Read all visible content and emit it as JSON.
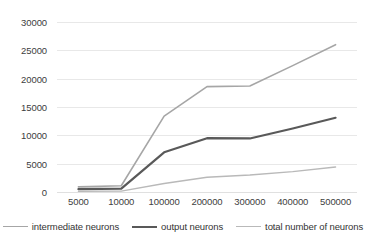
{
  "chart_data": {
    "type": "line",
    "title": "",
    "xlabel": "",
    "ylabel": "",
    "categories": [
      "5000",
      "10000",
      "100000",
      "200000",
      "300000",
      "400000",
      "500000"
    ],
    "ylim": [
      0,
      30000
    ],
    "yticks": [
      30000,
      25000,
      20000,
      15000,
      10000,
      5000,
      0
    ],
    "ytick_labels": [
      "30000",
      "25000",
      "20000",
      "15000",
      "10000",
      "5000",
      "0"
    ],
    "grid": true,
    "legend_position": "bottom",
    "series": [
      {
        "name": "intermediate neurons",
        "color": "#a6a6a6",
        "width": 1.6,
        "values": [
          900,
          1100,
          13400,
          18600,
          18700,
          22300,
          26000
        ]
      },
      {
        "name": "output neurons",
        "color": "#595959",
        "width": 2.2,
        "values": [
          500,
          600,
          7000,
          9500,
          9450,
          11200,
          13100
        ]
      },
      {
        "name": "total number of neurons",
        "color": "#b9b9b9",
        "width": 1.4,
        "values": [
          120,
          150,
          1500,
          2600,
          3000,
          3600,
          4400
        ]
      }
    ]
  },
  "legend": {
    "items": [
      {
        "label": "intermediate neurons"
      },
      {
        "label": "output neurons"
      },
      {
        "label": "total number of neurons"
      }
    ]
  },
  "colors": {
    "gridline": "#e8e8e8",
    "text": "#404040",
    "background": "#ffffff"
  }
}
